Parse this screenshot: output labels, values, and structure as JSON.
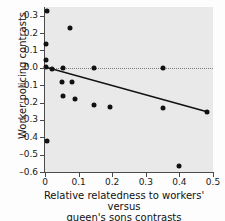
{
  "chart_data": {
    "type": "scatter",
    "title": "",
    "xlabel": "Relative relatedness to workers' versus queen's sons contrasts",
    "xlabel_line1": "Relative relatedness to workers' versus",
    "xlabel_line2": "queen's sons contrasts",
    "ylabel": "Worker policing contrasts",
    "xlim": [
      0.0,
      0.5
    ],
    "ylim": [
      -0.6,
      0.35
    ],
    "xticks": [
      0,
      0.1,
      0.2,
      0.3,
      0.4,
      0.5
    ],
    "xticklabels": [
      "0",
      "0.1",
      "0.2",
      "0.3",
      "0.4",
      "0.5"
    ],
    "yticks": [
      0.3,
      0.2,
      0.1,
      0.0,
      -0.1,
      -0.2,
      -0.3,
      -0.4,
      -0.5,
      -0.6
    ],
    "yticklabels": [
      "0.3",
      "0.2",
      "0.1",
      "0.0",
      "–0.1",
      "–0.2",
      "–0.3",
      "–0.4",
      "–0.5",
      "–0.6"
    ],
    "grid": false,
    "legend": null,
    "plot_background": "#e9e9e9",
    "point_color": "#111111",
    "line_color": "#111111",
    "zero_line": {
      "y": 0.0,
      "style": "dotted",
      "color": "#7c7c7c"
    },
    "fit_line": {
      "x_start": 0.0,
      "y_start": 0.005,
      "x_end": 0.485,
      "y_end": -0.255
    },
    "points": [
      {
        "x": 0.005,
        "y": 0.325
      },
      {
        "x": 0.004,
        "y": 0.135
      },
      {
        "x": 0.004,
        "y": 0.045
      },
      {
        "x": 0.002,
        "y": 0.002
      },
      {
        "x": 0.022,
        "y": -0.008
      },
      {
        "x": 0.075,
        "y": 0.23
      },
      {
        "x": 0.053,
        "y": 0.0
      },
      {
        "x": 0.147,
        "y": 0.0
      },
      {
        "x": 0.35,
        "y": 0.0
      },
      {
        "x": 0.05,
        "y": -0.082
      },
      {
        "x": 0.079,
        "y": -0.082
      },
      {
        "x": 0.054,
        "y": -0.162
      },
      {
        "x": 0.088,
        "y": -0.18
      },
      {
        "x": 0.145,
        "y": -0.215
      },
      {
        "x": 0.193,
        "y": -0.225
      },
      {
        "x": 0.35,
        "y": -0.232
      },
      {
        "x": 0.483,
        "y": -0.256
      },
      {
        "x": 0.006,
        "y": -0.42
      },
      {
        "x": 0.4,
        "y": -0.563
      }
    ]
  }
}
